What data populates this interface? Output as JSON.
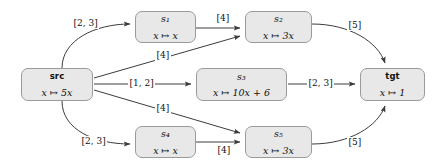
{
  "diagram": {
    "background": "#ffffff",
    "node_fill": "#e8e8e8",
    "node_border": "#9a9a9a",
    "edge_color": "#3c3c3c"
  },
  "nodes": [
    {
      "id": "src",
      "title": "src",
      "title_style": "bold",
      "body": "x ↦ 5x",
      "x": 21,
      "y": 68,
      "w": 72,
      "h": 33
    },
    {
      "id": "s1",
      "title": "s₁",
      "title_style": "italic",
      "body": "x ↦ x",
      "x": 135,
      "y": 11,
      "w": 61,
      "h": 32
    },
    {
      "id": "s2",
      "title": "s₂",
      "title_style": "italic",
      "body": "x ↦ 3x",
      "x": 245,
      "y": 11,
      "w": 67,
      "h": 32
    },
    {
      "id": "s3",
      "title": "s₃",
      "title_style": "italic",
      "body": "x ↦ 10x + 6",
      "x": 196,
      "y": 68,
      "w": 91,
      "h": 33
    },
    {
      "id": "s4",
      "title": "s₄",
      "title_style": "italic",
      "body": "x ↦ x",
      "x": 135,
      "y": 126,
      "w": 61,
      "h": 32
    },
    {
      "id": "s5",
      "title": "s₅",
      "title_style": "italic",
      "body": "x ↦ 3x",
      "x": 245,
      "y": 126,
      "w": 67,
      "h": 32
    },
    {
      "id": "tgt",
      "title": "tgt",
      "title_style": "bold",
      "body": "x ↦ 1",
      "x": 360,
      "y": 68,
      "w": 65,
      "h": 33
    }
  ],
  "edges": [
    {
      "id": "src-s1",
      "from": "src",
      "to": "s1",
      "label": "[2, 3]",
      "label_x": 72,
      "label_y": 18
    },
    {
      "id": "s1-s2",
      "from": "s1",
      "to": "s2",
      "label": "[4]",
      "label_x": 215,
      "label_y": 13
    },
    {
      "id": "src-s2",
      "from": "src",
      "to": "s2",
      "label": "[4]",
      "label_x": 155,
      "label_y": 50
    },
    {
      "id": "src-s3",
      "from": "src",
      "to": "s3",
      "label": "[1, 2]",
      "label_x": 128,
      "label_y": 78
    },
    {
      "id": "s3-tgt",
      "from": "s3",
      "to": "tgt",
      "label": "[2, 3]",
      "label_x": 307,
      "label_y": 78
    },
    {
      "id": "s2-tgt",
      "from": "s2",
      "to": "tgt",
      "label": "[5]",
      "label_x": 347,
      "label_y": 20
    },
    {
      "id": "src-s4",
      "from": "src",
      "to": "s4",
      "label": "[2, 3]",
      "label_x": 80,
      "label_y": 136
    },
    {
      "id": "s4-s5",
      "from": "s4",
      "to": "s5",
      "label": "[4]",
      "label_x": 216,
      "label_y": 145
    },
    {
      "id": "src-s5",
      "from": "src",
      "to": "s5",
      "label": "[4]",
      "label_x": 155,
      "label_y": 103
    },
    {
      "id": "s5-tgt",
      "from": "s5",
      "to": "tgt",
      "label": "[5]",
      "label_x": 347,
      "label_y": 137
    }
  ]
}
